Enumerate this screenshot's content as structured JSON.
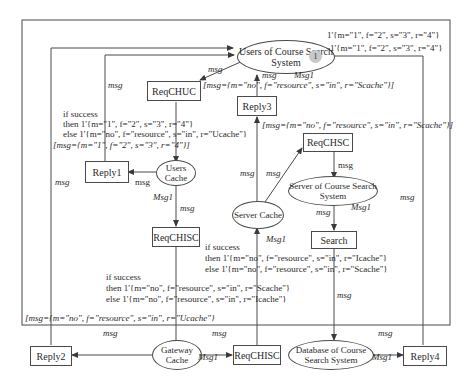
{
  "diagram": {
    "type": "colored-petri-net",
    "colors": {
      "line": "#4a4a4a",
      "token_fill": "#c8c8c8",
      "background": "#ffffff"
    },
    "places": {
      "users_of_course_search_system": "Users of Course Search System",
      "users_cache": "Users Cache",
      "server_cache": "Server Cache",
      "server_of_course_search_system": "Server of Course Search System",
      "gateway_cache": "Gateway Cache",
      "database_of_course_search_system": "Database of Course Search System"
    },
    "transitions": {
      "reqchuc": "ReqCHUC",
      "reply1": "Reply1",
      "reqchisc_upper": "ReqCHISC",
      "reply2": "Reply2",
      "reqchisc_lower": "ReqCHISC",
      "reply3": "Reply3",
      "reqchsc": "ReqCHSC",
      "search": "Search",
      "reply4": "Reply4"
    },
    "token": {
      "count": "1"
    },
    "initial_marking": [
      "1'{m=\"1\", f=\"2\", s=\"3\", r=\"4\"}",
      "1'{m=\"1\", f=\"2\", s=\"3\", r=\"4\"}"
    ],
    "arc_labels": {
      "msg": "msg",
      "Msg1": "Msg1"
    },
    "guards": {
      "reply1": "[msg={m=\"1\", f=\"2\", s=\"3\", r=\"4\"}]",
      "reply2": "[msg={m=\"no\", f=\"resource\", s=\"in\", r=\"Ucache\"}",
      "reply3_top": "[msg={m=\"no\", f=\"resource\", s=\"in\", r=\"Scache\"}]",
      "reply3_bottom": "[msg={m=\"no\", f=\"resource\", s=\"in\", r=\"Scache\"}]"
    },
    "conditions": {
      "users_cache": {
        "if": "if success",
        "then": "then 1'{m=\"1\", f=\"2\", s=\"3\", r=\"4\"}",
        "else": "else 1'{m=\"no\", f=\"resource\", s=\"in\", r=\"Ucache\"}"
      },
      "gateway_cache": {
        "if": "if success",
        "then": "then 1'{m=\"no\", f=\"resource\", s=\"in\", r=\"Scache\"}",
        "else": "else 1'{m=\"no\", f=\"resource\", s=\"in\", r=\"Icache\"}"
      },
      "server_cache": {
        "if": "if success",
        "then": "then 1'{m=\"no\", f=\"resource\", s=\"in\", r=\"Icache\"}",
        "else": "else 1'{m=\"no\", f=\"resource\", s=\"in\", r=\"Scache\"}"
      }
    }
  }
}
